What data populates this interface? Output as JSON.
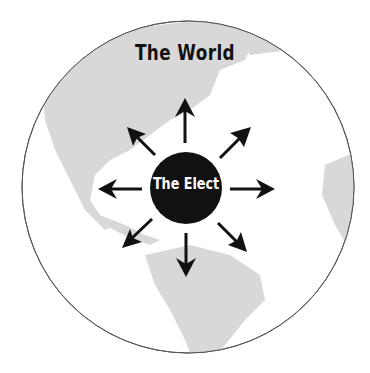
{
  "diagram": {
    "outer_label": "The World",
    "center_label": "The Elect",
    "outer_circle": {
      "cx": 188,
      "cy": 187,
      "r": 166,
      "fill": "#ffffff",
      "stroke": "#555555"
    },
    "center_circle": {
      "cx": 186,
      "cy": 187,
      "r": 36,
      "fill": "#111111"
    },
    "background_map": {
      "description": "world map of the Americas and West Africa",
      "land_color": "#d9d9d9"
    },
    "arrows": [
      {
        "direction": "up"
      },
      {
        "direction": "up-right"
      },
      {
        "direction": "right"
      },
      {
        "direction": "down-right"
      },
      {
        "direction": "down"
      },
      {
        "direction": "down-left"
      },
      {
        "direction": "left"
      },
      {
        "direction": "up-left"
      }
    ],
    "arrow_color": "#111111"
  }
}
